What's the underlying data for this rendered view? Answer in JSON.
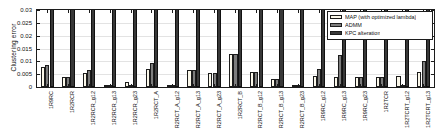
{
  "figure": {
    "background": "#ffffff",
    "frame_color": "#1c1c1c"
  },
  "chart_data": {
    "type": "bar",
    "title": "",
    "xlabel": "",
    "ylabel": "Clustering error",
    "ylim": [
      0,
      0.03
    ],
    "yticks": [
      0,
      0.005,
      0.01,
      0.015,
      0.02,
      0.025,
      0.03
    ],
    "ytick_labels": [
      "0",
      "0.005",
      "0.01",
      "0.015",
      "0.02",
      "0.025",
      "0.03"
    ],
    "grid": "faint-horizontal",
    "legend_position": "top-right-inside",
    "note": "KPC alteration bars exceed the axis maximum and are clipped at 0.03",
    "categories": [
      "1R9RC",
      "1R2RCR",
      "1R2RCR_g12",
      "1R2RCR_g13",
      "1R2RCR_g23",
      "1R2RCT_A",
      "R2RCT_A_g12",
      "R2RCT_A_g13",
      "R2RCT_A_g23",
      "1R2RCT_B",
      "R2RCT_B_g12",
      "R2RCT_B_g13",
      "R2RCT_B_g23",
      "1R9RC_g12",
      "1R9RC_g13",
      "1R9RC_g23",
      "1R2TCR",
      "1R2TCRT_g12",
      "1R2TCRT_g13"
    ],
    "series": [
      {
        "name": "MAP (with optimized lambda)",
        "color": "#fbf8ea",
        "border": "#1c1c1c",
        "values": [
          0.008,
          0.004,
          0.0055,
          0.0005,
          0.002,
          0.007,
          0.0005,
          0.0065,
          0.0055,
          0.013,
          0.006,
          0.003,
          0.0005,
          0.0045,
          0.004,
          0.004,
          0.004,
          0.0045,
          0.006
        ]
      },
      {
        "name": "ADMM",
        "color": "#7d7d7d",
        "border": "#1c1c1c",
        "values": [
          0.0085,
          0.004,
          0.0065,
          0.0005,
          0.0005,
          0.0095,
          0.0005,
          0.0065,
          0.0055,
          0.013,
          0.006,
          0.003,
          0.0005,
          0.007,
          0.0125,
          0.004,
          0.004,
          0.0005,
          0.01
        ]
      },
      {
        "name": "KPC alteration",
        "color": "#383838",
        "border": "#111111",
        "clipped": true,
        "values": [
          0.03,
          0.03,
          0.03,
          0.03,
          0.03,
          0.03,
          0.03,
          0.03,
          0.03,
          0.03,
          0.03,
          0.03,
          0.03,
          0.03,
          0.03,
          0.03,
          0.03,
          0.03,
          0.03
        ]
      }
    ]
  }
}
